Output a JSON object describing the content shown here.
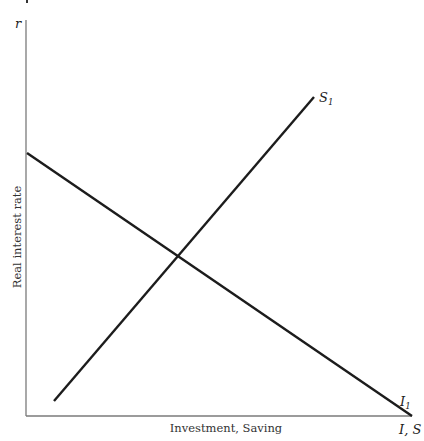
{
  "diagram": {
    "title": "",
    "y_axis": {
      "symbol": "r",
      "title": "Real interest rate"
    },
    "x_axis": {
      "symbol": "I, S",
      "title": "Investment, Saving"
    },
    "curves": [
      {
        "id": "investment",
        "label_main": "I",
        "label_sub": "1",
        "description": "Downward-sloping investment demand curve",
        "start": [
          27,
          153
        ],
        "end": [
          412,
          416
        ]
      },
      {
        "id": "saving",
        "label_main": "S",
        "label_sub": "1",
        "description": "Upward-sloping saving supply curve",
        "start": [
          54,
          401
        ],
        "end": [
          314,
          97
        ]
      }
    ],
    "equilibrium": {
      "x": 180,
      "y": 258
    },
    "colors": {
      "curve": "#1c1c1c",
      "axis": "#7a7a7a",
      "background": "#ffffff"
    }
  }
}
